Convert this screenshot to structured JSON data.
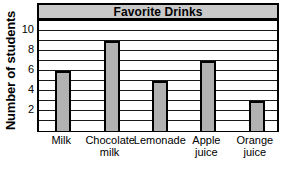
{
  "chart_data": {
    "type": "bar",
    "title": "Favorite Drinks",
    "xlabel": "",
    "ylabel": "Number of students",
    "categories": [
      "Milk",
      "Chocolate milk",
      "Lemonade",
      "Apple juice",
      "Orange juice"
    ],
    "values": [
      6,
      9,
      5,
      7,
      3
    ],
    "ylim": [
      0,
      11
    ],
    "ytick_labels": [
      "2",
      "4",
      "6",
      "8",
      "10"
    ],
    "ytick_values": [
      2,
      4,
      6,
      8,
      10
    ],
    "gridlines": [
      1,
      2,
      3,
      4,
      5,
      6,
      7,
      8,
      9,
      10,
      11
    ],
    "grid": true,
    "legend": "none",
    "colors": {
      "bar_fill": "#b2b2b2",
      "bar_outline": "#000000",
      "title_band": "#c9c9c9",
      "gridline": "#1a1a1a",
      "background": "#ffffff"
    }
  }
}
